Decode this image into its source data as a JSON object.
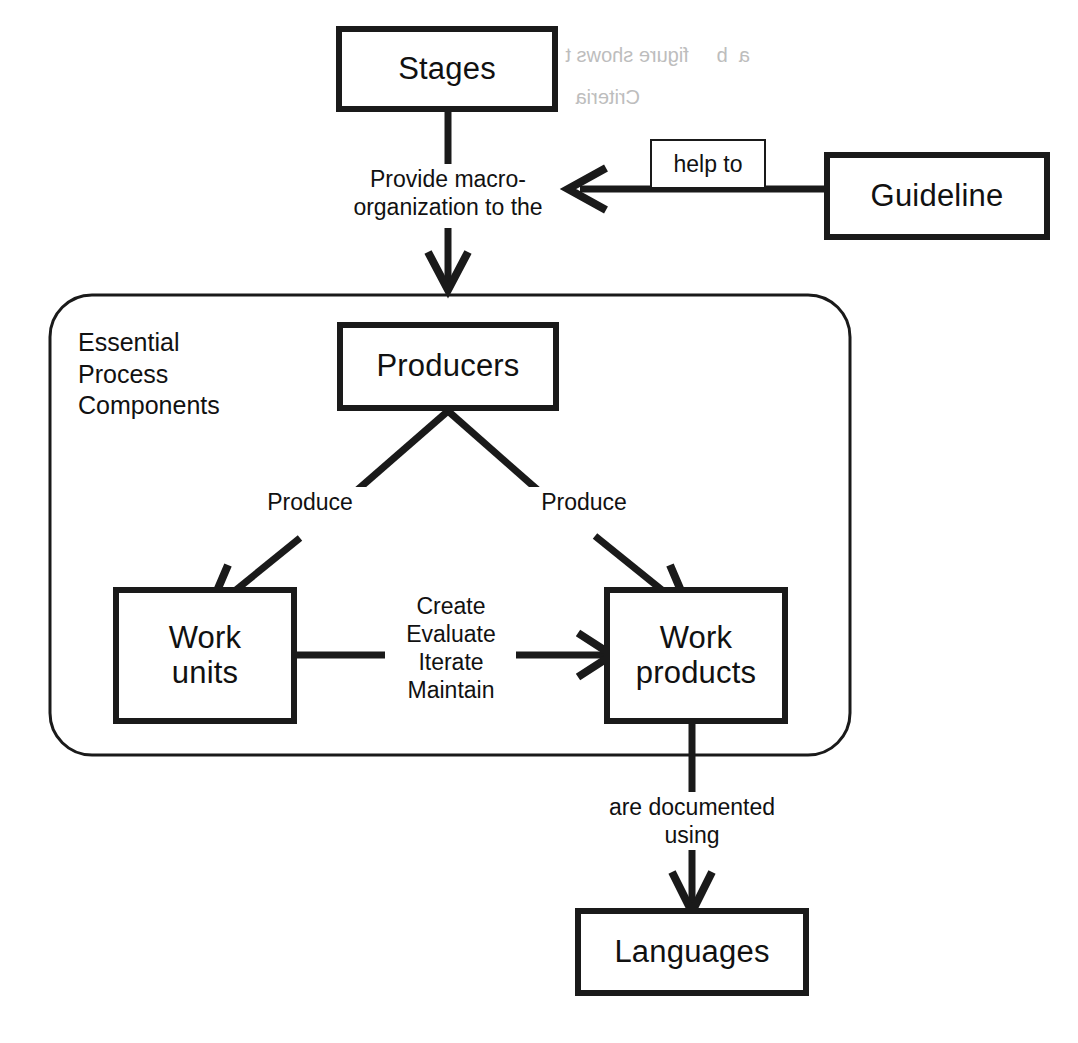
{
  "diagram": {
    "title": "Essential Process Components",
    "type": "flow-diagram",
    "background_color": "#ffffff",
    "stroke_color": "#1a1a1a",
    "nodes": {
      "stages": {
        "label": "Stages"
      },
      "guideline": {
        "label": "Guideline"
      },
      "producers": {
        "label": "Producers"
      },
      "work_units": {
        "label": "Work\nunits"
      },
      "work_products": {
        "label": "Work\nproducts"
      },
      "languages": {
        "label": "Languages"
      }
    },
    "group": {
      "caption": "Essential\nProcess\nComponents"
    },
    "edge_labels": {
      "provide_macro": "Provide macro-\norganization to the",
      "help_to": "help to",
      "produce_left": "Produce",
      "produce_right": "Produce",
      "create_evaluate": "Create\nEvaluate\nIterate\nMaintain",
      "documented_using": "are documented\nusing"
    },
    "bleed_through": {
      "line1": "a  b     figure shows t",
      "line2": "Criteria"
    }
  }
}
